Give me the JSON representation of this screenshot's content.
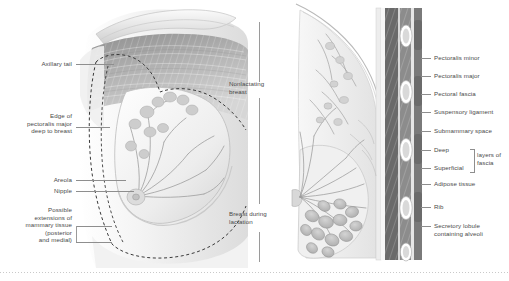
{
  "figure": {
    "background_color": "#ffffff",
    "label_color": "#4a4a4a",
    "leader_color": "#8e8e8e"
  },
  "left_panel": {
    "name": "anterior-cutaway-view",
    "labels": [
      {
        "id": "axillary-tail",
        "text": "Axillary tail"
      },
      {
        "id": "edge-pectoralis-major",
        "text": "Edge of\npectoralis major\ndeep to breast"
      },
      {
        "id": "areola",
        "text": "Areola"
      },
      {
        "id": "nipple",
        "text": "Nipple"
      },
      {
        "id": "possible-extensions",
        "text": "Possible\nextensions of\nmammary tissue\n(posterior\nand medial)"
      }
    ]
  },
  "center": {
    "name": "panel-divider-labels",
    "labels": [
      {
        "id": "nonlactating-breast",
        "text": "Nonlactating\nbreast"
      },
      {
        "id": "breast-during-lactation",
        "text": "Breast during\nlactation"
      }
    ]
  },
  "right_panel": {
    "name": "sagittal-section-view",
    "labels": [
      {
        "id": "pectoralis-minor",
        "text": "Pectoralis minor"
      },
      {
        "id": "pectoralis-major",
        "text": "Pectoralis major"
      },
      {
        "id": "pectoral-fascia",
        "text": "Pectoral fascia"
      },
      {
        "id": "suspensory-ligament",
        "text": "Suspensory ligament"
      },
      {
        "id": "submammary-space",
        "text": "Submammary space"
      },
      {
        "id": "deep-fascia",
        "text": "Deep"
      },
      {
        "id": "superficial-fascia",
        "text": "Superficial"
      },
      {
        "id": "layers-of-fascia",
        "text": "layers of\nfascia"
      },
      {
        "id": "adipose-tissue",
        "text": "Adipose tissue"
      },
      {
        "id": "rib",
        "text": "Rib"
      },
      {
        "id": "secretory-lobule",
        "text": "Secretory lobule\ncontaining alveoli"
      }
    ]
  }
}
